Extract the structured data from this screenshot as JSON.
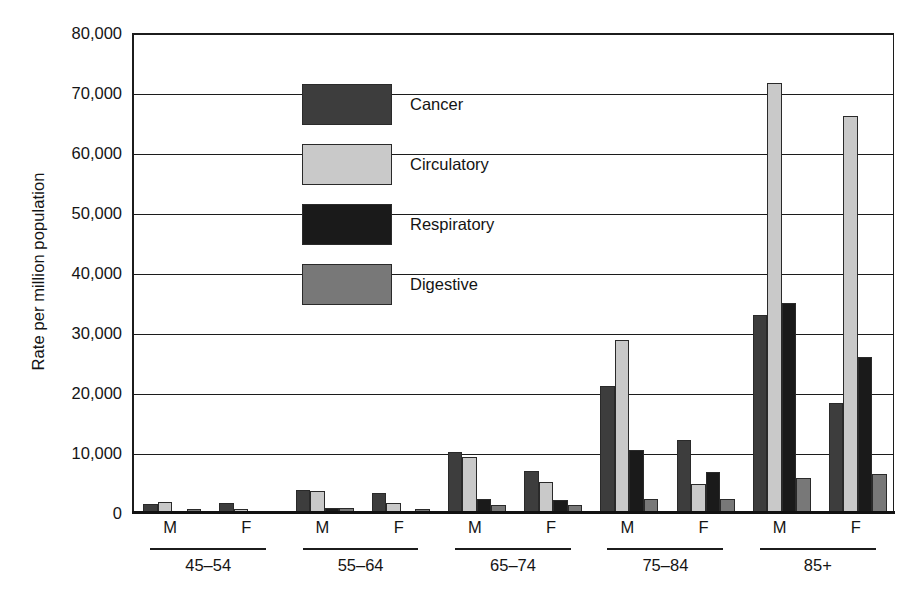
{
  "chart_data": {
    "type": "bar",
    "title": "",
    "xlabel": "",
    "ylabel": "Rate per million population",
    "ylim": [
      0,
      80000
    ],
    "ytick_values": [
      0,
      10000,
      20000,
      30000,
      40000,
      50000,
      60000,
      70000,
      80000
    ],
    "ytick_labels": [
      "0",
      "10,000",
      "20,000",
      "30,000",
      "40,000",
      "50,000",
      "60,000",
      "70,000",
      "80,000"
    ],
    "grid": true,
    "legend_position": "upper-left-inside",
    "age_groups": [
      "45–54",
      "55–64",
      "65–74",
      "75–84",
      "85+"
    ],
    "sexes": [
      "M",
      "F"
    ],
    "categories": [
      "45–54 M",
      "45–54 F",
      "55–64 M",
      "55–64 F",
      "65–74 M",
      "65–74 F",
      "75–84 M",
      "75–84 F",
      "85+ M",
      "85+ F"
    ],
    "series": [
      {
        "name": "Cancer",
        "color": "#3d3d3d",
        "values": [
          1500,
          1600,
          3800,
          3300,
          10200,
          7000,
          21200,
          12200,
          33000,
          18300
        ]
      },
      {
        "name": "Circulatory",
        "color": "#c9c9c9",
        "values": [
          1800,
          700,
          3700,
          1600,
          9300,
          5200,
          28900,
          4900,
          71700,
          66200
        ]
      },
      {
        "name": "Respiratory",
        "color": "#1a1a1a",
        "values": [
          400,
          300,
          900,
          400,
          2400,
          2100,
          10500,
          6800,
          35000,
          26000
        ]
      },
      {
        "name": "Digestive",
        "color": "#787878",
        "values": [
          600,
          400,
          800,
          600,
          1300,
          1300,
          2400,
          2300,
          5800,
          6500
        ]
      }
    ]
  },
  "axis": {
    "y_title": "Rate per million population"
  }
}
